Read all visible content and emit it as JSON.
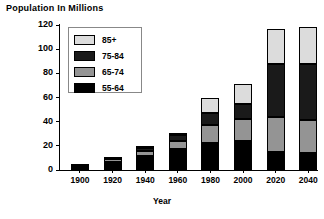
{
  "chart_data": {
    "type": "bar",
    "stacked": true,
    "title": "",
    "ylabel": "Population  In  Millions",
    "xlabel": "Year",
    "categories": [
      "1900",
      "1920",
      "1940",
      "1960",
      "1980",
      "2000",
      "2020",
      "2040"
    ],
    "ylim": [
      0,
      120
    ],
    "yticks": [
      0,
      20,
      40,
      60,
      80,
      100,
      120
    ],
    "ytick_labels": [
      "0",
      "20",
      "40",
      "60",
      "80",
      "100",
      "120"
    ],
    "grid": false,
    "legend_position": "upper-left-inside",
    "series": [
      {
        "name": "55-64",
        "color": "#000000",
        "values": [
          3,
          7,
          12,
          17,
          22,
          24,
          15,
          14
        ]
      },
      {
        "name": "65-74",
        "color": "#949494",
        "values": [
          1,
          2,
          4,
          7,
          15,
          18,
          29,
          27
        ]
      },
      {
        "name": "75-84",
        "color": "#1a1a1a",
        "values": [
          0,
          1,
          2,
          5,
          10,
          13,
          44,
          47
        ]
      },
      {
        "name": "85+",
        "color": "#dcdcdc",
        "values": [
          0,
          0,
          1,
          2,
          13,
          16,
          29,
          30
        ]
      }
    ],
    "totals": [
      4,
      10,
      19,
      31,
      60,
      71,
      117,
      118
    ],
    "stack_order_bottom_to_top": [
      "55-64",
      "65-74",
      "75-84",
      "85+"
    ]
  },
  "legend": {
    "entries": [
      {
        "label": "85+",
        "color": "#dcdcdc"
      },
      {
        "label": "75-84",
        "color": "#1a1a1a"
      },
      {
        "label": "65-74",
        "color": "#949494"
      },
      {
        "label": "55-64",
        "color": "#000000"
      }
    ]
  },
  "axes": {
    "y_title": "Population  In  Millions",
    "x_title": "Year"
  }
}
